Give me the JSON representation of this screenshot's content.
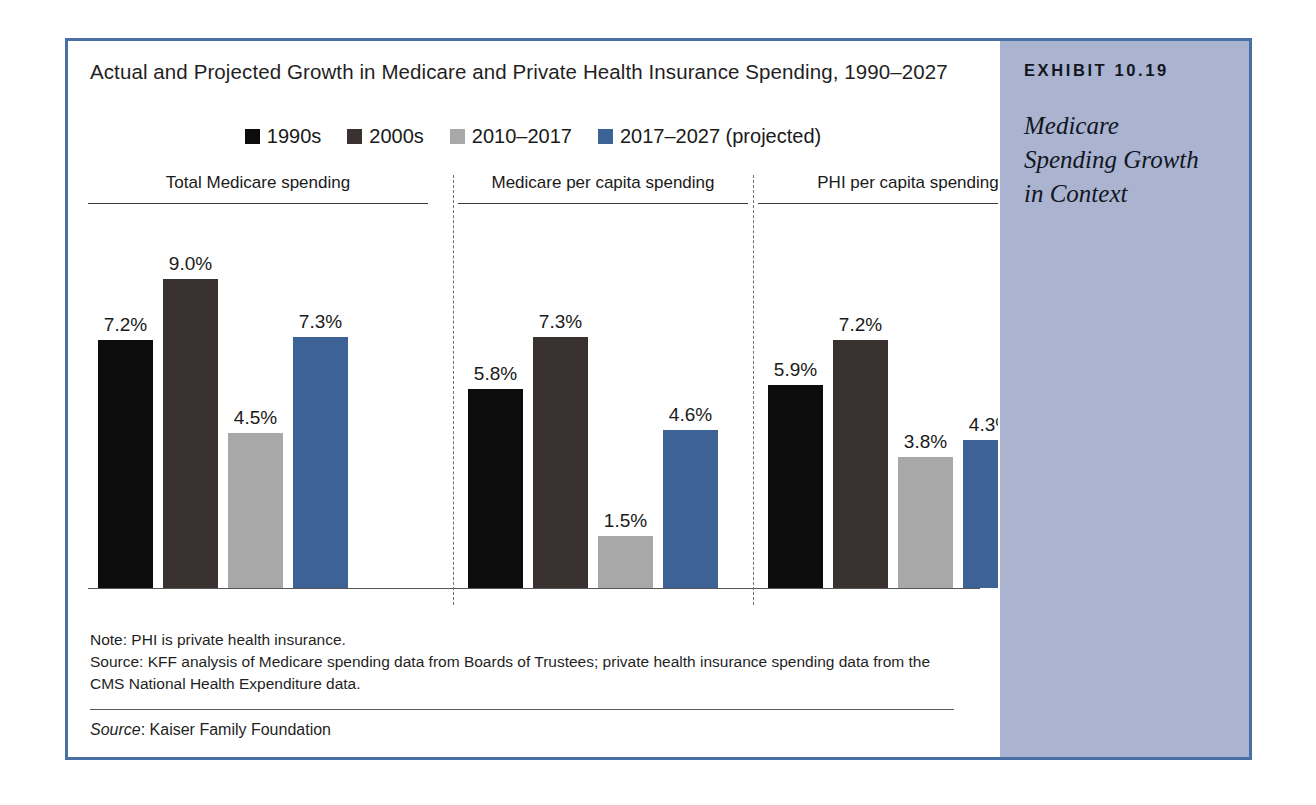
{
  "exhibit": {
    "number": "EXHIBIT 10.19",
    "caption": "Medicare Spending Growth in Context",
    "border_color": "#4a6fa5",
    "sidebar_color": "#aab3d0"
  },
  "chart_data": {
    "type": "bar",
    "title": "Actual and Projected Growth in Medicare and Private Health Insurance Spending, 1990–2027",
    "xlabel": "",
    "ylabel": "",
    "ylim": [
      0,
      9.6
    ],
    "grid": false,
    "legend_position": "top-center",
    "categories": [
      "Total Medicare spending",
      "Medicare per capita spending",
      "PHI per capita spending"
    ],
    "series": [
      {
        "name": "1990s",
        "color": "#0d0c0c",
        "values": [
          7.2,
          5.8,
          5.9
        ],
        "labels": [
          "7.2%",
          "5.8%",
          "5.9%"
        ]
      },
      {
        "name": "2000s",
        "color": "#3a3230",
        "values": [
          9.0,
          7.3,
          7.2
        ],
        "labels": [
          "9.0%",
          "7.3%",
          "7.2%"
        ]
      },
      {
        "name": "2010–2017",
        "color": "#a8a8a8",
        "values": [
          4.5,
          1.5,
          3.8
        ],
        "labels": [
          "4.5%",
          "1.5%",
          "3.8%"
        ]
      },
      {
        "name": "2017–2027 (projected)",
        "color": "#3c6296",
        "values": [
          7.3,
          4.6,
          4.3
        ],
        "labels": [
          "7.3%",
          "4.6%",
          "4.3%"
        ]
      }
    ],
    "value_suffix": "%",
    "notes": [
      "Note: PHI is private health insurance.",
      "Source: KFF analysis of Medicare spending data from Boards of Trustees; private health insurance spending data from the CMS National Health Expenditure data."
    ],
    "source_label": "Source",
    "source_text": ": Kaiser Family Foundation"
  }
}
